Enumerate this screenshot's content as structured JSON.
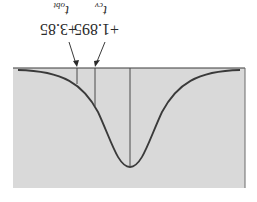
{
  "diagram": {
    "type": "t-distribution one-tailed test",
    "orientation": "rotated 180 degrees",
    "colors": {
      "region_fill": "#d9d9d9",
      "curve": "#3a3a3a",
      "lines": "#4a4a4a",
      "background": "#ffffff"
    },
    "markers": [
      {
        "id": "t_obt",
        "value": "+3.85",
        "symbol": "t",
        "subscript": "obt"
      },
      {
        "id": "t_cv",
        "value": "+1.895",
        "symbol": "t",
        "subscript": "cv"
      }
    ]
  }
}
